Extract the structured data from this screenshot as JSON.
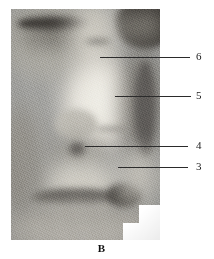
{
  "figure": {
    "panel_caption": "B",
    "palette": {
      "ink": "#1a1a1a",
      "leader_line": "#2b2b2b",
      "page_background": "#ffffff",
      "plate_midtone": "#9a9a97",
      "plate_highlight": "#e6e3db",
      "plate_shadow": "#3a3733"
    }
  },
  "annotations": [
    {
      "id": "leader-6",
      "label": "6",
      "label_x": 196,
      "label_y": 51,
      "line_x": 100,
      "line_y": 57,
      "line_width": 90
    },
    {
      "id": "leader-5",
      "label": "5",
      "label_x": 196,
      "label_y": 90,
      "line_x": 115,
      "line_y": 96,
      "line_width": 76
    },
    {
      "id": "leader-4",
      "label": "4",
      "label_x": 196,
      "label_y": 140,
      "line_x": 85,
      "line_y": 146,
      "line_width": 103
    },
    {
      "id": "leader-3",
      "label": "3",
      "label_x": 196,
      "label_y": 161,
      "line_x": 118,
      "line_y": 167,
      "line_width": 70
    }
  ],
  "plate_regions": [
    {
      "name": "upper-left-periorbital-skin",
      "x": -10,
      "y": -8,
      "w": 95,
      "h": 78,
      "shade": "#a6a49c",
      "blur": "soft"
    },
    {
      "name": "eyelid-lash-band",
      "x": 6,
      "y": 8,
      "w": 74,
      "h": 13,
      "shade": "#2e2b28",
      "blur": "hard"
    },
    {
      "name": "lash-fringe-shadow",
      "x": 10,
      "y": 18,
      "w": 66,
      "h": 16,
      "shade": "#55524c",
      "blur": "soft"
    },
    {
      "name": "upper-right-dark-orbit",
      "x": 104,
      "y": -12,
      "w": 60,
      "h": 52,
      "shade": "#3d3a36",
      "blur": "hard"
    },
    {
      "name": "right-orbit-rim-highlight",
      "x": 112,
      "y": 6,
      "w": 40,
      "h": 22,
      "shade": "#8e8b83",
      "blur": "soft"
    },
    {
      "name": "nasal-dorsum-pale-band",
      "x": 60,
      "y": -8,
      "w": 46,
      "h": 70,
      "shade": "#c9c6bd",
      "blur": "soft"
    },
    {
      "name": "exposed-sac-bright-field",
      "x": 52,
      "y": 48,
      "w": 74,
      "h": 92,
      "shade": "#ddd9d0",
      "blur": "soft"
    },
    {
      "name": "sac-core-highlight",
      "x": 66,
      "y": 62,
      "w": 48,
      "h": 60,
      "shade": "#eceae2",
      "blur": "soft"
    },
    {
      "name": "medial-canthal-tendon-ridge",
      "x": 44,
      "y": 100,
      "w": 42,
      "h": 30,
      "shade": "#b7b4ab",
      "blur": "hard"
    },
    {
      "name": "lateral-muscle-shadow",
      "x": 112,
      "y": 40,
      "w": 34,
      "h": 110,
      "shade": "#6b6862",
      "blur": "soft"
    },
    {
      "name": "lateral-fascia-edge",
      "x": 124,
      "y": 52,
      "w": 20,
      "h": 96,
      "shade": "#565350",
      "blur": "hard"
    },
    {
      "name": "inferior-orbital-rim-shadow",
      "x": 40,
      "y": 130,
      "w": 54,
      "h": 30,
      "shade": "#8b8880",
      "blur": "soft"
    },
    {
      "name": "duct-opening-dark-notch",
      "x": 58,
      "y": 134,
      "w": 16,
      "h": 14,
      "shade": "#4a4743",
      "blur": "hard"
    },
    {
      "name": "lower-lid-pale-cushion",
      "x": 30,
      "y": 152,
      "w": 80,
      "h": 48,
      "shade": "#cdcac1",
      "blur": "soft"
    },
    {
      "name": "lower-lid-margin-dark-arc",
      "x": 18,
      "y": 180,
      "w": 92,
      "h": 16,
      "shade": "#4c4945",
      "blur": "hard"
    },
    {
      "name": "cheek-skin-field",
      "x": -6,
      "y": 190,
      "w": 150,
      "h": 56,
      "shade": "#a3a099",
      "blur": "soft"
    },
    {
      "name": "left-cheek-shadow",
      "x": -14,
      "y": 96,
      "w": 46,
      "h": 110,
      "shade": "#8d8a83",
      "blur": "soft"
    },
    {
      "name": "nostril-dark-wedge",
      "x": 96,
      "y": 174,
      "w": 34,
      "h": 24,
      "shade": "#3f3c38",
      "blur": "hard"
    },
    {
      "name": "nostril-rim-highlight",
      "x": 104,
      "y": 186,
      "w": 26,
      "h": 12,
      "shade": "#8a8780",
      "blur": "soft"
    },
    {
      "name": "lateral-lower-pale-wedge",
      "x": 108,
      "y": 140,
      "w": 38,
      "h": 52,
      "shade": "#bdbab2",
      "blur": "soft"
    },
    {
      "name": "vessel-streak-upper",
      "x": 74,
      "y": 30,
      "w": 26,
      "h": 5,
      "shade": "#77746e",
      "blur": "hard"
    },
    {
      "name": "vessel-streak-mid",
      "x": 84,
      "y": 118,
      "w": 34,
      "h": 4,
      "shade": "#84817b",
      "blur": "hard"
    },
    {
      "name": "bottom-edge-grain",
      "x": -8,
      "y": 214,
      "w": 160,
      "h": 26,
      "shade": "#b2afa8",
      "blur": "soft"
    }
  ]
}
